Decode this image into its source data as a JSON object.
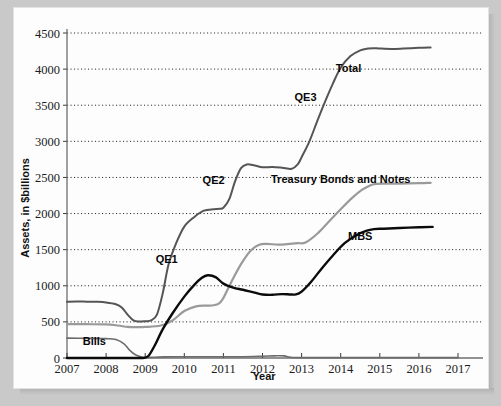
{
  "chart_data": {
    "type": "line",
    "title": "",
    "xlabel": "Year",
    "ylabel": "Assets, in $billions",
    "xlim": [
      2007,
      2017
    ],
    "ylim": [
      0,
      4500
    ],
    "grid": true,
    "legend_position": "inline-annotations",
    "yticks": [
      0,
      500,
      1000,
      1500,
      2000,
      2500,
      3000,
      3500,
      4000,
      4500
    ],
    "xticks": [
      2007,
      2008,
      2009,
      2010,
      2011,
      2012,
      2013,
      2014,
      2015,
      2016,
      2017
    ],
    "annotations": [
      {
        "text": "Bills",
        "x": 2007.7,
        "y": 175
      },
      {
        "text": "QE1",
        "x": 2009.55,
        "y": 1320
      },
      {
        "text": "QE2",
        "x": 2010.75,
        "y": 2410
      },
      {
        "text": "QE3",
        "x": 2013.1,
        "y": 3560
      },
      {
        "text": "Total",
        "x": 2014.2,
        "y": 3960
      },
      {
        "text": "Treasury Bonds and Notes",
        "x": 2014.0,
        "y": 2430
      },
      {
        "text": "MBS",
        "x": 2014.5,
        "y": 1640
      }
    ],
    "series": [
      {
        "name": "Total",
        "color": "#555555",
        "width": 2.0,
        "x": [
          2007.0,
          2007.25,
          2007.5,
          2007.75,
          2008.0,
          2008.25,
          2008.4,
          2008.55,
          2008.7,
          2008.85,
          2009.0,
          2009.15,
          2009.3,
          2009.45,
          2009.6,
          2009.8,
          2010.0,
          2010.25,
          2010.5,
          2010.75,
          2010.9,
          2011.0,
          2011.15,
          2011.3,
          2011.45,
          2011.6,
          2011.8,
          2012.0,
          2012.25,
          2012.5,
          2012.75,
          2012.9,
          2013.0,
          2013.2,
          2013.4,
          2013.6,
          2013.8,
          2014.0,
          2014.25,
          2014.5,
          2014.7,
          2014.85,
          2015.0,
          2015.3,
          2015.6,
          2016.0,
          2016.3
        ],
        "y": [
          780,
          782,
          780,
          778,
          770,
          745,
          700,
          600,
          520,
          505,
          510,
          520,
          600,
          900,
          1300,
          1600,
          1820,
          1950,
          2040,
          2060,
          2065,
          2080,
          2200,
          2450,
          2630,
          2680,
          2665,
          2640,
          2645,
          2635,
          2620,
          2680,
          2780,
          3000,
          3280,
          3550,
          3800,
          4020,
          4180,
          4260,
          4285,
          4290,
          4285,
          4280,
          4285,
          4295,
          4300
        ]
      },
      {
        "name": "Treasury Bonds and Notes",
        "color": "#9a9a9a",
        "width": 2.2,
        "x": [
          2007.0,
          2007.5,
          2008.0,
          2008.3,
          2008.55,
          2008.75,
          2009.0,
          2009.4,
          2009.7,
          2010.0,
          2010.3,
          2010.55,
          2010.75,
          2010.9,
          2011.0,
          2011.2,
          2011.45,
          2011.7,
          2011.9,
          2012.1,
          2012.4,
          2012.7,
          2012.9,
          2013.1,
          2013.4,
          2013.7,
          2014.0,
          2014.3,
          2014.55,
          2014.75,
          2014.9,
          2015.1,
          2015.5,
          2016.0,
          2016.3
        ],
        "y": [
          470,
          468,
          465,
          450,
          430,
          428,
          430,
          450,
          520,
          650,
          715,
          725,
          730,
          760,
          830,
          1050,
          1300,
          1490,
          1565,
          1580,
          1570,
          1580,
          1590,
          1600,
          1720,
          1890,
          2060,
          2220,
          2330,
          2390,
          2410,
          2415,
          2415,
          2420,
          2425
        ]
      },
      {
        "name": "MBS",
        "color": "#0b0b0b",
        "width": 2.4,
        "x": [
          2007.0,
          2008.0,
          2008.6,
          2008.9,
          2009.0,
          2009.1,
          2009.25,
          2009.45,
          2009.7,
          2010.0,
          2010.25,
          2010.45,
          2010.6,
          2010.8,
          2011.0,
          2011.25,
          2011.5,
          2011.8,
          2012.0,
          2012.25,
          2012.5,
          2012.7,
          2012.85,
          2013.0,
          2013.25,
          2013.5,
          2013.8,
          2014.1,
          2014.4,
          2014.65,
          2014.85,
          2015.1,
          2015.5,
          2016.0,
          2016.35
        ],
        "y": [
          0,
          0,
          0,
          0,
          5,
          40,
          180,
          400,
          620,
          850,
          1010,
          1110,
          1145,
          1120,
          1030,
          975,
          945,
          905,
          880,
          875,
          885,
          880,
          880,
          920,
          1060,
          1230,
          1420,
          1590,
          1700,
          1760,
          1785,
          1790,
          1800,
          1810,
          1815
        ]
      },
      {
        "name": "Bills",
        "color": "#6b6b6b",
        "width": 1.6,
        "x": [
          2007.0,
          2007.5,
          2008.0,
          2008.25,
          2008.45,
          2008.6,
          2008.75,
          2008.9,
          2009.0,
          2009.5,
          2010.0,
          2010.5,
          2011.0,
          2011.5,
          2012.0,
          2012.3,
          2012.55,
          2012.7,
          2013.0,
          2014.0,
          2015.0,
          2016.0,
          2017.0
        ],
        "y": [
          275,
          272,
          268,
          255,
          200,
          110,
          45,
          15,
          8,
          15,
          18,
          18,
          18,
          18,
          25,
          30,
          30,
          12,
          5,
          5,
          5,
          5,
          5
        ]
      }
    ]
  },
  "axes": {
    "y_title": "Assets, in $billions",
    "x_title": "Year"
  }
}
